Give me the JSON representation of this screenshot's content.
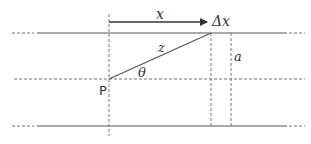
{
  "diagram": {
    "labels": {
      "x": "x",
      "delta_x": "Δx",
      "z": "z",
      "theta": "θ",
      "a": "a",
      "point": "P"
    },
    "colors": {
      "line": "#555555",
      "dashed": "#777777",
      "arrow": "#333333",
      "text": "#333333"
    }
  }
}
